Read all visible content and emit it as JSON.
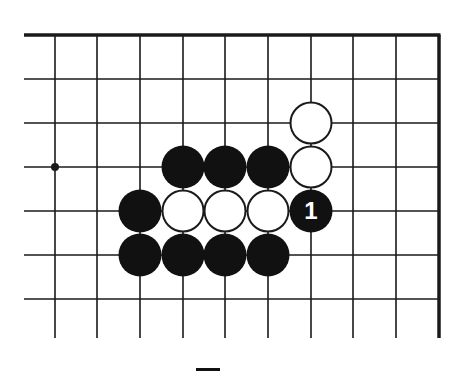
{
  "diagram": {
    "type": "go-board-fragment",
    "colors": {
      "background": "#ffffff",
      "line": "#1a1a1a",
      "black_stone": "#111111",
      "white_stone": "#ffffff",
      "label_on_black": "#ffffff"
    },
    "grid": {
      "columns_x": [
        55,
        97,
        140,
        183,
        225,
        268,
        311,
        353,
        396
      ],
      "rows_y": [
        79,
        123,
        167,
        211,
        255,
        299
      ],
      "top_edge_y": 35,
      "right_edge_x": 439,
      "left_open_x": 24,
      "bottom_open_y": 338
    },
    "star_points": [
      {
        "x": 55,
        "y": 167
      }
    ],
    "stones": [
      {
        "color": "white",
        "x": 311,
        "y": 123,
        "label": ""
      },
      {
        "color": "white",
        "x": 311,
        "y": 167,
        "label": ""
      },
      {
        "color": "black",
        "x": 183,
        "y": 167,
        "label": ""
      },
      {
        "color": "black",
        "x": 225,
        "y": 167,
        "label": ""
      },
      {
        "color": "black",
        "x": 268,
        "y": 167,
        "label": ""
      },
      {
        "color": "black",
        "x": 140,
        "y": 211,
        "label": ""
      },
      {
        "color": "white",
        "x": 183,
        "y": 211,
        "label": ""
      },
      {
        "color": "white",
        "x": 225,
        "y": 211,
        "label": ""
      },
      {
        "color": "white",
        "x": 268,
        "y": 211,
        "label": ""
      },
      {
        "color": "black",
        "x": 311,
        "y": 211,
        "label": "1"
      },
      {
        "color": "black",
        "x": 140,
        "y": 255,
        "label": ""
      },
      {
        "color": "black",
        "x": 183,
        "y": 255,
        "label": ""
      },
      {
        "color": "black",
        "x": 225,
        "y": 255,
        "label": ""
      },
      {
        "color": "black",
        "x": 268,
        "y": 255,
        "label": ""
      }
    ],
    "stone_radius": 21.5
  },
  "caption": {
    "text": ""
  }
}
